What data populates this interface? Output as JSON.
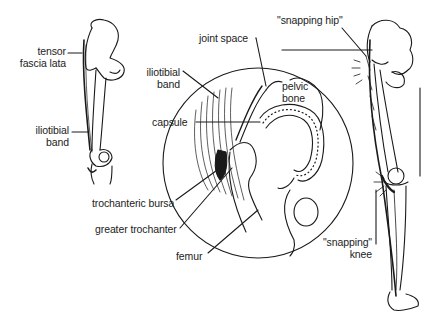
{
  "diagram": {
    "colors": {
      "ink": "#1a1a1a",
      "background": "#ffffff"
    },
    "left_leg": {
      "labels": [
        {
          "id": "tensor",
          "line1": "tensor",
          "line2": "fascia lata"
        },
        {
          "id": "itb",
          "line1": "iliotibial",
          "line2": "band"
        }
      ]
    },
    "inset": {
      "labels": [
        {
          "id": "joint_space",
          "text": "joint space"
        },
        {
          "id": "itb",
          "line1": "iliotibial",
          "line2": "band"
        },
        {
          "id": "pelvic",
          "line1": "pelvic",
          "line2": "bone"
        },
        {
          "id": "capsule",
          "text": "capsule"
        },
        {
          "id": "bursa",
          "text": "trochanteric bursa"
        },
        {
          "id": "trochanter",
          "text": "greater trochanter"
        },
        {
          "id": "femur",
          "text": "femur"
        }
      ]
    },
    "right_leg": {
      "labels": [
        {
          "id": "hip",
          "text": "\"snapping hip\""
        },
        {
          "id": "knee",
          "line1": "\"snapping\"",
          "line2": "knee"
        }
      ]
    }
  }
}
